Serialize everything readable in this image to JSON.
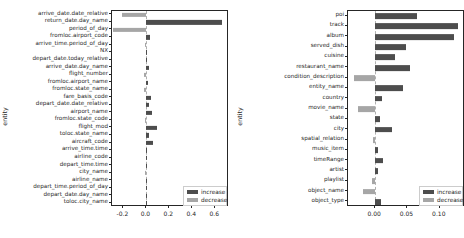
{
  "figure": {
    "background": "#ffffff",
    "increase_color": "#4d4d4d",
    "decrease_color": "#a6a6a6"
  },
  "legend": {
    "increase_label": "increase",
    "decrease_label": "decrease"
  },
  "chart_data": [
    {
      "type": "bar",
      "orientation": "horizontal",
      "title": "",
      "xlabel": "",
      "ylabel": "entity",
      "xlim": [
        -0.3,
        0.72
      ],
      "xticks": [
        -0.2,
        0.0,
        0.2,
        0.4,
        0.6
      ],
      "xticklabels": [
        "-0.2",
        "0.0",
        "0.2",
        "0.4",
        "0.6"
      ],
      "grid": false,
      "legend_position": "lower right",
      "legend": [
        "increase",
        "decrease"
      ],
      "categories": [
        "arrive_date.date_relative",
        "return_date.day_name",
        "period_of_day",
        "fromloc.airport_code",
        "arrive_time.period_of_day",
        "NX",
        "depart_date.today_relative",
        "arrive_date.day_name",
        "flight_number",
        "fromloc.airport_name",
        "fromloc.state_name",
        "fare_basis_code",
        "depart_date.date_relative",
        "airport_name",
        "fromloc.state_code",
        "flight_mod",
        "toloc.state_name",
        "aircraft_code",
        "arrive_time.time",
        "airline_code",
        "depart_time.time",
        "city_name",
        "airline_name",
        "depart_time.period_of_day",
        "depart_date.day_name",
        "toloc.city_name"
      ],
      "values": [
        -0.215,
        0.655,
        -0.29,
        0.032,
        -0.016,
        0.003,
        0.0,
        0.022,
        -0.021,
        0.012,
        -0.022,
        0.041,
        0.019,
        0.047,
        -0.009,
        0.096,
        0.022,
        0.055,
        0.008,
        0.0,
        0.003,
        -0.012,
        0.0,
        0.0,
        0.0,
        0.0
      ]
    },
    {
      "type": "bar",
      "orientation": "horizontal",
      "title": "",
      "xlabel": "",
      "ylabel": "entity",
      "xlim": [
        -0.042,
        0.139
      ],
      "xticks": [
        0.0,
        0.05,
        0.1
      ],
      "xticklabels": [
        "0.00",
        "0.05",
        "0.10"
      ],
      "grid": false,
      "legend_position": "lower right",
      "legend": [
        "increase",
        "decrease"
      ],
      "categories": [
        "poi",
        "track",
        "album",
        "served_dish",
        "cuisine",
        "restaurant_name",
        "condition_description",
        "entity_name",
        "country",
        "movie_name",
        "state",
        "city",
        "spatial_relation",
        "music_item",
        "timeRange",
        "artist",
        "playlist",
        "object_name",
        "object_type"
      ],
      "values": [
        0.065,
        0.128,
        0.122,
        0.047,
        0.031,
        0.054,
        -0.032,
        0.043,
        0.01,
        -0.026,
        0.008,
        0.026,
        -0.004,
        0.005,
        0.012,
        0.005,
        -0.005,
        -0.019,
        0.009
      ]
    }
  ]
}
